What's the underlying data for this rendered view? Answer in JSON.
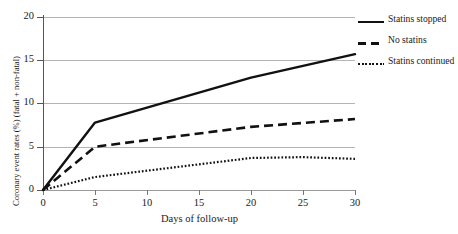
{
  "chart_data": {
    "type": "line",
    "title": "",
    "xlabel": "Days of follow-up",
    "ylabel": "Coronary event rates (%) (fatal + non-fatal)",
    "xlim": [
      0,
      30
    ],
    "ylim": [
      0,
      20
    ],
    "xticks": [
      0,
      5,
      10,
      15,
      20,
      25,
      30
    ],
    "yticks": [
      0,
      5,
      10,
      15,
      20
    ],
    "grid": "horizontal",
    "legend_position": "top-right",
    "series": [
      {
        "name": "Statins stopped",
        "style": "solid",
        "color": "#111111",
        "x": [
          0,
          5,
          20,
          30
        ],
        "values": [
          0,
          7.8,
          13.0,
          15.7
        ]
      },
      {
        "name": "No statins",
        "style": "dashed",
        "color": "#111111",
        "x": [
          0,
          5,
          20,
          30
        ],
        "values": [
          0,
          5.0,
          7.3,
          8.2
        ]
      },
      {
        "name": "Statins continued",
        "style": "dotted",
        "color": "#111111",
        "x": [
          0,
          5,
          20,
          25,
          30
        ],
        "values": [
          0,
          1.5,
          3.7,
          3.8,
          3.6
        ]
      }
    ]
  },
  "axes": {
    "y_tick_labels": [
      "20",
      "15",
      "10",
      "5",
      "0"
    ],
    "x_tick_labels": [
      "0",
      "5",
      "10",
      "15",
      "20",
      "25",
      "30"
    ],
    "x_title": "Days of follow-up",
    "y_title": "Coronary event rates (%) (fatal + non-fatal)"
  },
  "legend": {
    "items": [
      {
        "label": "Statins stopped",
        "style": "solid"
      },
      {
        "label": "No statins",
        "style": "dashed"
      },
      {
        "label": "Statins continued",
        "style": "dotted"
      }
    ]
  }
}
